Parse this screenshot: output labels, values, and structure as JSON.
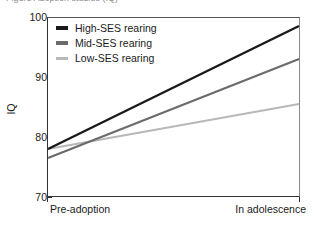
{
  "caption": "Figure  Adoption studies (IQ)",
  "chart_data": {
    "type": "line",
    "title": "",
    "xlabel": "",
    "ylabel": "IQ",
    "x": [
      "Pre-adoption",
      "In adolescence"
    ],
    "categories": [
      "Pre-adoption",
      "In adolescence"
    ],
    "ylim": [
      70,
      100
    ],
    "yticks": [
      70,
      80,
      90,
      100
    ],
    "ytick_labels": [
      "70",
      "80",
      "90",
      "100"
    ],
    "grid": "horizontal-light",
    "legend_position": "top-left-inside",
    "series": [
      {
        "name": "High-SES rearing",
        "values": [
          78.0,
          98.5
        ],
        "color": "#1a1a1a"
      },
      {
        "name": "Mid-SES rearing",
        "values": [
          76.5,
          93.0
        ],
        "color": "#6b6b6b"
      },
      {
        "name": "Low-SES rearing",
        "values": [
          78.0,
          85.5
        ],
        "color": "#b8b8b8"
      }
    ]
  },
  "axes": {
    "y_title": "IQ",
    "y_ticks": [
      "100",
      "90",
      "80",
      "70"
    ],
    "x_labels": [
      "Pre-adoption",
      "In adolescence"
    ]
  },
  "legend": {
    "items": [
      {
        "label": "High-SES rearing",
        "color": "#1a1a1a"
      },
      {
        "label": "Mid-SES rearing",
        "color": "#6b6b6b"
      },
      {
        "label": "Low-SES rearing",
        "color": "#b8b8b8"
      }
    ]
  },
  "colors": {
    "high_ses": "#1a1a1a",
    "mid_ses": "#6b6b6b",
    "low_ses": "#b8b8b8",
    "grid": "#d9d9d9",
    "axis": "#333333",
    "background": "#ffffff"
  }
}
